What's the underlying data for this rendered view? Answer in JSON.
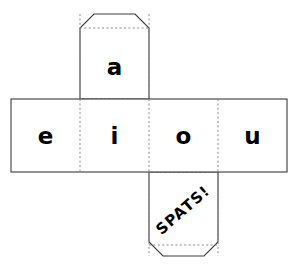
{
  "document": {
    "title": "Cube Net Template",
    "type": "printable-cube-net",
    "background_color": "#ffffff"
  },
  "style": {
    "cut_line_color": "#3a3a3a",
    "fold_line_color": "#8a8a8a",
    "text_color": "#000000",
    "fill_color": "#ffffff",
    "cut_line_width": 1.1,
    "fold_line_width": 1,
    "fold_dash": "2,2.4"
  },
  "net": {
    "band": {
      "left": 11,
      "top": 99,
      "right": 287,
      "bottom": 172,
      "fold_x": [
        80,
        149,
        218
      ]
    },
    "top_flap": {
      "left": 80,
      "top": 14,
      "right": 149,
      "bottom": 99,
      "chamfer": 14
    },
    "bottom_flap": {
      "left": 149,
      "top": 172,
      "right": 218,
      "bottom": 256,
      "chamfer": 14,
      "inner_fold_y": 245
    }
  },
  "faces": [
    {
      "id": "face-a",
      "label": "a",
      "position": "top-flap",
      "rotation": 0
    },
    {
      "id": "face-e",
      "label": "e",
      "position": "band-1",
      "rotation": 0
    },
    {
      "id": "face-i",
      "label": "i",
      "position": "band-2",
      "rotation": 0
    },
    {
      "id": "face-o",
      "label": "o",
      "position": "band-3",
      "rotation": 0
    },
    {
      "id": "face-u",
      "label": "u",
      "position": "band-4",
      "rotation": 0
    },
    {
      "id": "face-spats",
      "label": "SPATS!",
      "position": "bottom-flap",
      "rotation": -41
    }
  ],
  "labels": {
    "a": "a",
    "e": "e",
    "i": "i",
    "o": "o",
    "u": "u",
    "spats": "SPATS!"
  }
}
